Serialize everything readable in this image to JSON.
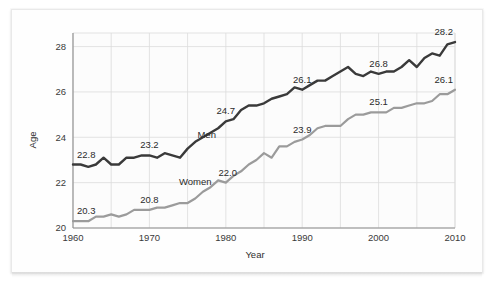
{
  "chart_data": {
    "type": "line",
    "title": "",
    "xlabel": "Year",
    "ylabel": "Age",
    "xlim": [
      1960,
      2010
    ],
    "ylim": [
      20,
      28.6
    ],
    "grid": true,
    "legend_position": "inline-annotations",
    "x_ticks": [
      "1960",
      "1970",
      "1980",
      "1990",
      "2000",
      "2010"
    ],
    "x_tick_values": [
      1960,
      1970,
      1980,
      1990,
      2000,
      2010
    ],
    "y_ticks": [
      "20",
      "22",
      "24",
      "26",
      "28"
    ],
    "y_tick_values": [
      20,
      22,
      24,
      26,
      28
    ],
    "x": [
      1960,
      1961,
      1962,
      1963,
      1964,
      1965,
      1966,
      1967,
      1968,
      1969,
      1970,
      1971,
      1972,
      1973,
      1974,
      1975,
      1976,
      1977,
      1978,
      1979,
      1980,
      1981,
      1982,
      1983,
      1984,
      1985,
      1986,
      1987,
      1988,
      1989,
      1990,
      1991,
      1992,
      1993,
      1994,
      1995,
      1996,
      1997,
      1998,
      1999,
      2000,
      2001,
      2002,
      2003,
      2004,
      2005,
      2006,
      2007,
      2008,
      2009,
      2010
    ],
    "series": [
      {
        "name": "Men",
        "color": "#3a3a3a",
        "values": [
          22.8,
          22.8,
          22.7,
          22.8,
          23.1,
          22.8,
          22.8,
          23.1,
          23.1,
          23.2,
          23.2,
          23.1,
          23.3,
          23.2,
          23.1,
          23.5,
          23.8,
          24.0,
          24.2,
          24.4,
          24.7,
          24.8,
          25.2,
          25.4,
          25.4,
          25.5,
          25.7,
          25.8,
          25.9,
          26.2,
          26.1,
          26.3,
          26.5,
          26.5,
          26.7,
          26.9,
          27.1,
          26.8,
          26.7,
          26.9,
          26.8,
          26.9,
          26.9,
          27.1,
          27.4,
          27.1,
          27.5,
          27.7,
          27.6,
          28.1,
          28.2
        ]
      },
      {
        "name": "Women",
        "color": "#9b9b9b",
        "values": [
          20.3,
          20.3,
          20.3,
          20.5,
          20.5,
          20.6,
          20.5,
          20.6,
          20.8,
          20.8,
          20.8,
          20.9,
          20.9,
          21.0,
          21.1,
          21.1,
          21.3,
          21.6,
          21.8,
          22.1,
          22.0,
          22.3,
          22.5,
          22.8,
          23.0,
          23.3,
          23.1,
          23.6,
          23.6,
          23.8,
          23.9,
          24.1,
          24.4,
          24.5,
          24.5,
          24.5,
          24.8,
          25.0,
          25.0,
          25.1,
          25.1,
          25.1,
          25.3,
          25.3,
          25.4,
          25.5,
          25.5,
          25.6,
          25.9,
          25.9,
          26.1
        ]
      }
    ],
    "point_labels": [
      {
        "series": "Men",
        "text": "22.8",
        "x_value": 1960,
        "y_value": 22.8
      },
      {
        "series": "Men",
        "text": "23.2",
        "x_value": 1970,
        "y_value": 23.2
      },
      {
        "series": "Men",
        "text": "24.7",
        "x_value": 1980,
        "y_value": 24.7
      },
      {
        "series": "Men",
        "text": "26.1",
        "x_value": 1990,
        "y_value": 26.1
      },
      {
        "series": "Men",
        "text": "26.8",
        "x_value": 2000,
        "y_value": 26.8
      },
      {
        "series": "Men",
        "text": "28.2",
        "x_value": 2010,
        "y_value": 28.2
      },
      {
        "series": "Women",
        "text": "20.3",
        "x_value": 1960,
        "y_value": 20.3
      },
      {
        "series": "Women",
        "text": "20.8",
        "x_value": 1970,
        "y_value": 20.8
      },
      {
        "series": "Women",
        "text": "22.0",
        "x_value": 1980,
        "y_value": 22.0
      },
      {
        "series": "Women",
        "text": "23.9",
        "x_value": 1990,
        "y_value": 23.9
      },
      {
        "series": "Women",
        "text": "25.1",
        "x_value": 2000,
        "y_value": 25.1
      },
      {
        "series": "Women",
        "text": "26.1",
        "x_value": 2010,
        "y_value": 26.1
      }
    ],
    "series_annotations": [
      {
        "text": "Men",
        "x_value": 1977.5,
        "y_value": 23.95
      },
      {
        "text": "Women",
        "x_value": 1976.0,
        "y_value": 21.9
      }
    ]
  },
  "axis": {
    "y_label": "Age",
    "x_label": "Year"
  }
}
